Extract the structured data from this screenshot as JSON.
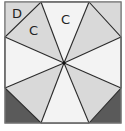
{
  "diagram": {
    "type": "octagon-in-square dissection",
    "labels": [
      {
        "text": "D",
        "region": "top-left corner triangle"
      },
      {
        "text": "C",
        "region": "top-left sector triangle"
      },
      {
        "text": "C",
        "region": "top sector triangle"
      }
    ],
    "colors": {
      "light_region": "#f0f0f0",
      "mid_region": "#d9d9d9",
      "dark_corner": "#5a5a5a",
      "stroke": "#2a2a2a",
      "border": "#888888"
    },
    "shaded_dark_corners": [
      "bottom-left",
      "bottom-right"
    ]
  }
}
